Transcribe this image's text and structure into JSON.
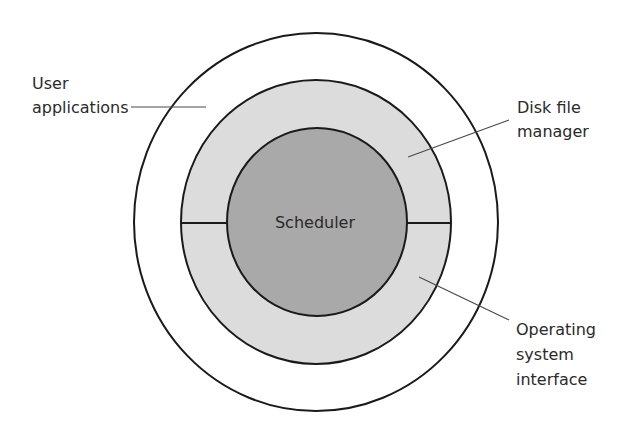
{
  "diagram": {
    "layers": [
      {
        "id": "outer",
        "name": "User applications",
        "fill": "#ffffff"
      },
      {
        "id": "middle",
        "name": "Disk file manager / Operating system interface",
        "fill": "#dcdcdc"
      },
      {
        "id": "inner",
        "name": "Scheduler",
        "fill": "#a9a9a9"
      }
    ],
    "center_label": "Scheduler",
    "labels": {
      "user_applications": {
        "line1": "User",
        "line2": "applications"
      },
      "disk_file_manager": {
        "line1": "Disk file",
        "line2": "manager"
      },
      "os_interface": {
        "line1": "Operating",
        "line2": "system",
        "line3": "interface"
      }
    },
    "stroke_color": "#1a1a1a",
    "leader_color": "#4a4a4a"
  }
}
